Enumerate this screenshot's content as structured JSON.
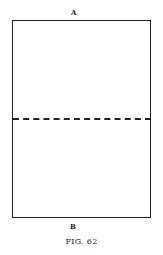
{
  "figure": {
    "label_top": "A",
    "label_bottom": "B",
    "caption": "FIG. 62"
  },
  "colors": {
    "line": "#222222",
    "background": "#ffffff"
  }
}
